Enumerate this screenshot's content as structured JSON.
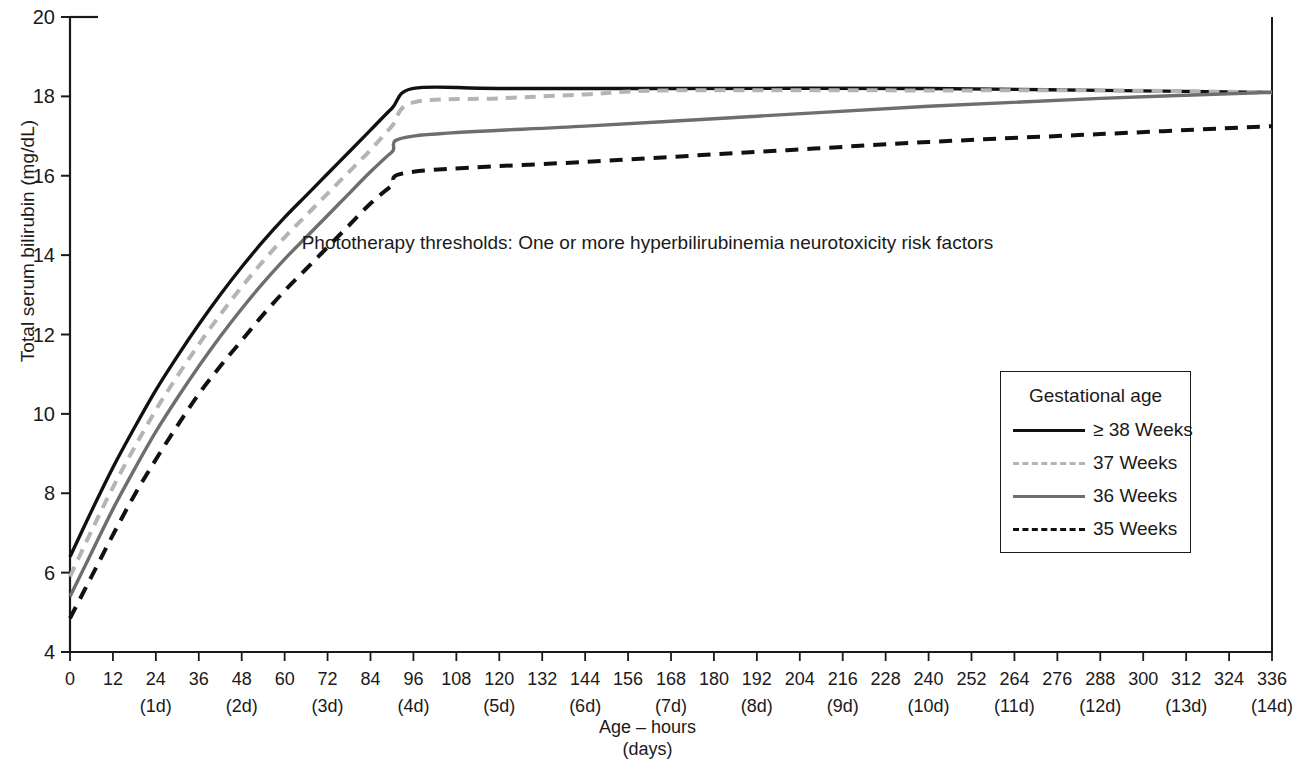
{
  "chart_data": {
    "type": "line",
    "title": "Phototherapy thresholds: One or more hyperbilirubinemia neurotoxicity risk factors",
    "xlabel_line1": "Age – hours",
    "xlabel_line2": "(days)",
    "ylabel": "Total serum bilirubin (mg/dL)",
    "ylim": [
      4,
      20
    ],
    "ytick_values": [
      4,
      6,
      8,
      10,
      12,
      14,
      16,
      18,
      20
    ],
    "ytick_labels": [
      "4",
      "6",
      "8",
      "10",
      "12",
      "14",
      "16",
      "18",
      "20"
    ],
    "xlim": [
      0,
      336
    ],
    "xtick_values": [
      0,
      12,
      24,
      36,
      48,
      60,
      72,
      84,
      96,
      108,
      120,
      132,
      144,
      156,
      168,
      180,
      192,
      204,
      216,
      228,
      240,
      252,
      264,
      276,
      288,
      300,
      312,
      324,
      336
    ],
    "xtick_labels": [
      "0",
      "12",
      "24",
      "36",
      "48",
      "60",
      "72",
      "84",
      "96",
      "108",
      "120",
      "132",
      "144",
      "156",
      "168",
      "180",
      "192",
      "204",
      "216",
      "228",
      "240",
      "252",
      "264",
      "276",
      "288",
      "300",
      "312",
      "324",
      "336"
    ],
    "xtick_day_labels": [
      {
        "hours": 24,
        "label": "(1d)"
      },
      {
        "hours": 48,
        "label": "(2d)"
      },
      {
        "hours": 72,
        "label": "(3d)"
      },
      {
        "hours": 96,
        "label": "(4d)"
      },
      {
        "hours": 120,
        "label": "(5d)"
      },
      {
        "hours": 144,
        "label": "(6d)"
      },
      {
        "hours": 168,
        "label": "(7d)"
      },
      {
        "hours": 192,
        "label": "(8d)"
      },
      {
        "hours": 216,
        "label": "(9d)"
      },
      {
        "hours": 240,
        "label": "(10d)"
      },
      {
        "hours": 264,
        "label": "(11d)"
      },
      {
        "hours": 288,
        "label": "(12d)"
      },
      {
        "hours": 312,
        "label": "(13d)"
      },
      {
        "hours": 336,
        "label": "(14d)"
      }
    ],
    "grid": false,
    "legend_position": "right-middle",
    "legend_title": "Gestational age",
    "series": [
      {
        "name": "≥ 38 Weeks",
        "color": "#111111",
        "style": "solid",
        "x": [
          0,
          6,
          12,
          18,
          24,
          30,
          36,
          42,
          48,
          54,
          60,
          66,
          72,
          78,
          84,
          90,
          96,
          120,
          168,
          240,
          288,
          336
        ],
        "y": [
          6.4,
          7.55,
          8.65,
          9.65,
          10.6,
          11.45,
          12.25,
          13.0,
          13.7,
          14.35,
          14.95,
          15.5,
          16.05,
          16.6,
          17.15,
          17.7,
          18.2,
          18.2,
          18.2,
          18.2,
          18.15,
          18.1
        ]
      },
      {
        "name": "37 Weeks",
        "color": "#b4b4b4",
        "style": "dashed",
        "x": [
          0,
          6,
          12,
          18,
          24,
          30,
          36,
          42,
          48,
          54,
          60,
          66,
          72,
          78,
          84,
          90,
          96,
          120,
          144,
          168,
          240,
          288,
          336
        ],
        "y": [
          5.9,
          7.05,
          8.15,
          9.15,
          10.1,
          10.95,
          11.75,
          12.5,
          13.2,
          13.85,
          14.45,
          15.0,
          15.55,
          16.1,
          16.65,
          17.25,
          17.85,
          17.95,
          18.05,
          18.15,
          18.15,
          18.15,
          18.1
        ]
      },
      {
        "name": "36 Weeks",
        "color": "#6e6e6e",
        "style": "solid",
        "x": [
          0,
          6,
          12,
          18,
          24,
          30,
          36,
          42,
          48,
          54,
          60,
          66,
          72,
          78,
          84,
          90,
          96,
          144,
          192,
          240,
          288,
          336
        ],
        "y": [
          5.4,
          6.5,
          7.6,
          8.6,
          9.55,
          10.4,
          11.2,
          11.95,
          12.65,
          13.3,
          13.9,
          14.45,
          15.0,
          15.55,
          16.1,
          16.6,
          17.0,
          17.25,
          17.5,
          17.75,
          17.95,
          18.1
        ]
      },
      {
        "name": "35 Weeks",
        "color": "#111111",
        "style": "dashed",
        "x": [
          0,
          6,
          12,
          18,
          24,
          30,
          36,
          42,
          48,
          54,
          60,
          66,
          72,
          78,
          84,
          90,
          96,
          144,
          192,
          240,
          288,
          336
        ],
        "y": [
          4.85,
          5.9,
          6.95,
          7.95,
          8.85,
          9.7,
          10.5,
          11.2,
          11.85,
          12.5,
          13.1,
          13.65,
          14.2,
          14.75,
          15.3,
          15.75,
          16.1,
          16.35,
          16.6,
          16.85,
          17.05,
          17.25
        ]
      }
    ]
  },
  "legend": {
    "title": "Gestational age",
    "items": [
      {
        "label": "≥ 38 Weeks"
      },
      {
        "label": "37 Weeks"
      },
      {
        "label": "36 Weeks"
      },
      {
        "label": "35 Weeks"
      }
    ]
  },
  "axis": {
    "ylabel": "Total serum bilirubin (mg/dL)",
    "xlabel_line1": "Age – hours",
    "xlabel_line2": "(days)"
  },
  "annotation": {
    "text": "Phototherapy thresholds: One or more hyperbilirubinemia neurotoxicity risk factors"
  }
}
